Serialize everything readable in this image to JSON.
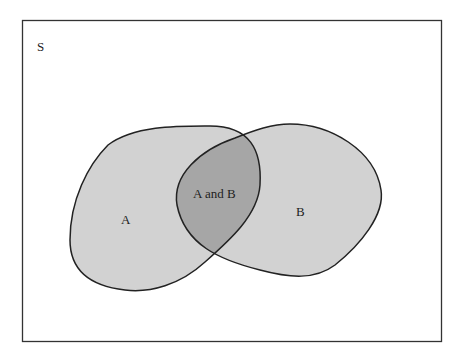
{
  "diagram": {
    "type": "venn",
    "universe_label": "S",
    "sets": [
      {
        "name": "A",
        "label": "A"
      },
      {
        "name": "B",
        "label": "B"
      }
    ],
    "intersection_label": "A and B",
    "colors": {
      "set_fill": "#d2d2d2",
      "intersection_fill": "#a6a6a6",
      "stroke": "#222222",
      "background": "#ffffff"
    }
  }
}
